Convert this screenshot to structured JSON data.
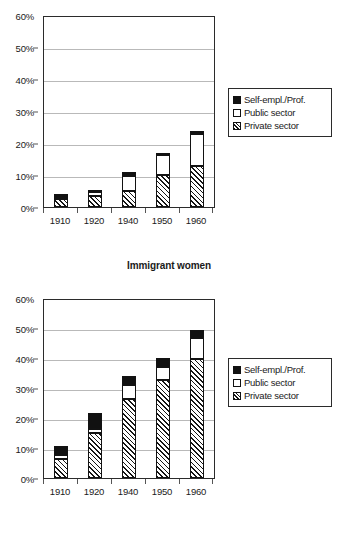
{
  "figure": {
    "caption_middle": "Immigrant women"
  },
  "legend": {
    "position": "right",
    "items": [
      {
        "label": "Self-empl./Prof.",
        "key": "self",
        "swatch": "solid-black-swatch"
      },
      {
        "label": "Public sector",
        "key": "public",
        "swatch": "white-swatch"
      },
      {
        "label": "Private sector",
        "key": "private",
        "swatch": "hatched-swatch"
      }
    ]
  },
  "chart_data": [
    {
      "id": "chart-1",
      "type": "bar",
      "stacked": true,
      "title": "",
      "subject": "Immigrant women",
      "xlabel": "",
      "ylabel": "",
      "categories": [
        "1910",
        "1920",
        "1940",
        "1950",
        "1960"
      ],
      "ylim": [
        0,
        60
      ],
      "ytick_labels": [
        "0%",
        "10%",
        "20%",
        "30%",
        "40%",
        "50%",
        "60%"
      ],
      "ytick_values": [
        0,
        10,
        20,
        30,
        40,
        50,
        60
      ],
      "grid": true,
      "legend_position": "right",
      "series": [
        {
          "name": "Private sector",
          "values": [
            2.5,
            3.4,
            5.0,
            10.0,
            13.0
          ]
        },
        {
          "name": "Public sector",
          "values": [
            0.4,
            1.2,
            4.8,
            6.4,
            10.0
          ]
        },
        {
          "name": "Self-empl./Prof.",
          "values": [
            1.3,
            0.9,
            1.3,
            0.8,
            1.1
          ]
        }
      ],
      "totals": [
        4.2,
        5.5,
        11.1,
        17.2,
        24.1
      ]
    },
    {
      "id": "chart-2",
      "type": "bar",
      "stacked": true,
      "title": "",
      "subject": "",
      "xlabel": "",
      "ylabel": "",
      "categories": [
        "1910",
        "1920",
        "1940",
        "1950",
        "1960"
      ],
      "ylim": [
        0,
        60
      ],
      "ytick_labels": [
        "0%",
        "10%",
        "20%",
        "30%",
        "40%",
        "50%",
        "60%"
      ],
      "ytick_values": [
        0,
        10,
        20,
        30,
        40,
        50,
        60
      ],
      "grid": true,
      "legend_position": "right",
      "series": [
        {
          "name": "Private sector",
          "values": [
            6.4,
            15.1,
            26.6,
            32.9,
            40.1
          ]
        },
        {
          "name": "Public sector",
          "values": [
            1.5,
            1.5,
            4.9,
            4.6,
            7.0
          ]
        },
        {
          "name": "Self-empl./Prof.",
          "values": [
            2.9,
            5.4,
            3.0,
            3.0,
            2.9
          ]
        }
      ],
      "totals": [
        10.8,
        22.0,
        34.5,
        40.5,
        50.0
      ]
    }
  ]
}
